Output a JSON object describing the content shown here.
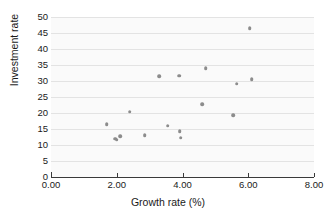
{
  "chart_data": {
    "type": "scatter",
    "title": "",
    "xlabel": "Growth rate (%)",
    "ylabel": "Investment rate",
    "xlim": [
      0.0,
      8.0
    ],
    "ylim": [
      0,
      50
    ],
    "xticks": [
      "0.00",
      "2.00",
      "4.00",
      "6.00",
      "8.00"
    ],
    "xtick_values": [
      0.0,
      2.0,
      4.0,
      6.0,
      8.0
    ],
    "yticks": [
      "0",
      "5",
      "10",
      "15",
      "20",
      "25",
      "30",
      "35",
      "40",
      "45",
      "50"
    ],
    "ytick_values": [
      0,
      5,
      10,
      15,
      20,
      25,
      30,
      35,
      40,
      45,
      50
    ],
    "grid": "horizontal",
    "legend": null,
    "marker_color": "#8c8c8c",
    "plot_background": "#fafafa",
    "gridline_color": "#e3e3e3",
    "axis_color": "#3a3a3a",
    "points": [
      {
        "x": 1.7,
        "y": 16.5
      },
      {
        "x": 1.95,
        "y": 12.0
      },
      {
        "x": 2.0,
        "y": 11.7
      },
      {
        "x": 2.1,
        "y": 12.7
      },
      {
        "x": 2.4,
        "y": 20.4
      },
      {
        "x": 2.85,
        "y": 13.0
      },
      {
        "x": 3.3,
        "y": 31.5
      },
      {
        "x": 3.55,
        "y": 16.0
      },
      {
        "x": 3.9,
        "y": 31.6
      },
      {
        "x": 3.92,
        "y": 14.4
      },
      {
        "x": 3.95,
        "y": 12.3
      },
      {
        "x": 4.6,
        "y": 22.8
      },
      {
        "x": 4.7,
        "y": 34.0
      },
      {
        "x": 5.55,
        "y": 19.3
      },
      {
        "x": 5.65,
        "y": 29.1
      },
      {
        "x": 6.05,
        "y": 46.5
      },
      {
        "x": 6.1,
        "y": 30.5
      }
    ]
  }
}
